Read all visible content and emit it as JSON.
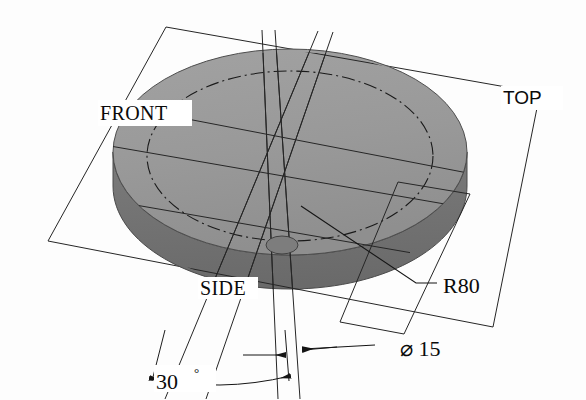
{
  "drawing": {
    "title": "Isometric disc with reference planes",
    "background_color": "#fdfdfd",
    "line_color": "#1c1c1c",
    "top_face_color": "#9a9a9a",
    "side_face_color": "#707070",
    "plane_labels": [
      {
        "id": "front",
        "text": "FRONT",
        "x": 100,
        "y": 120
      },
      {
        "id": "top",
        "text": "TOP",
        "x": 503,
        "y": 104
      },
      {
        "id": "side",
        "text": "SIDE",
        "x": 200,
        "y": 295
      }
    ],
    "dimensions": [
      {
        "id": "radius",
        "text": "R80",
        "x": 443,
        "y": 293,
        "kind": "radius-leader"
      },
      {
        "id": "hole-diameter",
        "symbol": "⌀",
        "value": "15",
        "text": "⌀ 15",
        "x": 400,
        "y": 356,
        "kind": "diameter-leader"
      },
      {
        "id": "angle",
        "value": "30",
        "unit": "°",
        "text": "30°",
        "x": 186,
        "y": 387,
        "kind": "angular"
      }
    ],
    "features": {
      "disc": {
        "name": "circular-plate",
        "radius_label": "R80",
        "center_x": 290,
        "center_y": 165
      },
      "hole": {
        "name": "through-hole",
        "diameter_label": "⌀15",
        "x": 282,
        "y": 245
      },
      "angle_between_planes": "30°"
    }
  }
}
